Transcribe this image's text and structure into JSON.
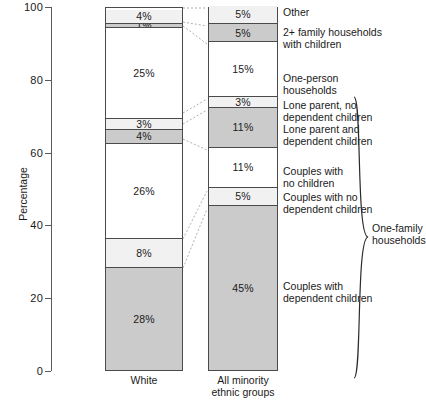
{
  "chart_data": {
    "type": "bar",
    "title": "",
    "xlabel": "",
    "ylabel": "Percentage",
    "ylim": [
      0,
      100
    ],
    "yticks": [
      0,
      20,
      40,
      60,
      80,
      100
    ],
    "ytick_labels": [
      "0",
      "20",
      "40",
      "60",
      "80",
      "100"
    ],
    "grid": false,
    "stacked": true,
    "legend_position": "right-labels",
    "categories": [
      "White",
      "All minority ethnic groups"
    ],
    "category_labels": [
      "White",
      "All minority\nethnic groups"
    ],
    "series": [
      {
        "name": "Couples with dependent children",
        "shade": "dark",
        "values": [
          28,
          45
        ],
        "labels": [
          "28%",
          "45%"
        ]
      },
      {
        "name": "Couples with no dependent children",
        "shade": "light",
        "values": [
          8,
          5
        ],
        "labels": [
          "8%",
          "5%"
        ]
      },
      {
        "name": "Couples with no children",
        "shade": "white",
        "values": [
          26,
          11
        ],
        "labels": [
          "26%",
          "11%"
        ]
      },
      {
        "name": "Lone parent and dependent children",
        "shade": "dark",
        "values": [
          4,
          11
        ],
        "labels": [
          "4%",
          "11%"
        ]
      },
      {
        "name": "Lone parent, no dependent children",
        "shade": "light",
        "values": [
          3,
          3
        ],
        "labels": [
          "3%",
          "3%"
        ]
      },
      {
        "name": "One-person households",
        "shade": "white",
        "values": [
          25,
          15
        ],
        "labels": [
          "25%",
          "15%"
        ]
      },
      {
        "name": "2+ family households with children",
        "shade": "dark",
        "values": [
          1,
          5
        ],
        "labels": [
          "1%",
          "5%"
        ]
      },
      {
        "name": "Other",
        "shade": "light",
        "values": [
          4,
          5
        ],
        "labels": [
          "4%",
          "5%"
        ]
      }
    ],
    "annotations": {
      "bracket_label": "One-family\nhouseholds",
      "bracket_covers": [
        "Couples with dependent children",
        "Couples with no dependent children",
        "Couples with no children",
        "Lone parent and dependent children",
        "Lone parent, no dependent children"
      ]
    },
    "colors": {
      "dark_fill": "#cbcbcb",
      "light_fill": "#f1f1f1",
      "white_fill": "#ffffff",
      "outline": "#4a4a4a",
      "text": "#1a1a1a"
    }
  },
  "series_labels": [
    {
      "text": "Other"
    },
    {
      "text": "2+ family households\nwith children"
    },
    {
      "text": "One-person\nhouseholds"
    },
    {
      "text": "Lone parent, no\ndependent children"
    },
    {
      "text": "Lone parent and\ndependent children"
    },
    {
      "text": "Couples with\nno children"
    },
    {
      "text": "Couples with no\ndependent children"
    },
    {
      "text": "Couples with\ndependent children"
    }
  ]
}
